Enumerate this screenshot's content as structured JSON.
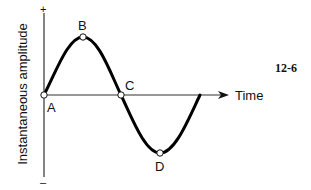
{
  "diagram": {
    "figure_number": "12-6",
    "y_axis_label": "Instantaneous amplitude",
    "y_axis_plus": "+",
    "y_axis_minus": "–",
    "x_axis_label": "Time",
    "points": {
      "A": "A",
      "B": "B",
      "C": "C",
      "D": "D"
    },
    "curve_type": "sine wave (one full cycle)",
    "colors": {
      "curve": "#000000",
      "axes": "#333333",
      "text": "#111111",
      "background": "#ffffff"
    }
  }
}
